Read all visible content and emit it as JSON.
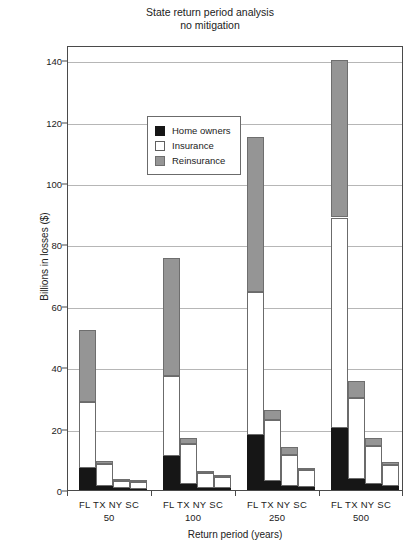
{
  "chart_data": {
    "type": "bar",
    "subtype": "stacked-grouped-bar",
    "title": "State return period analysis",
    "subtitle": "no mitigation",
    "xlabel": "Return period (years)",
    "ylabel": "Billions in losses ($)",
    "ylim": [
      0,
      145
    ],
    "yticks": [
      0,
      20,
      40,
      60,
      80,
      100,
      120,
      140
    ],
    "ytick_labels": [
      "0",
      "20",
      "40",
      "60",
      "80",
      "100",
      "120",
      "140"
    ],
    "grid": "horizontal",
    "legend_position": "upper-left-inside",
    "groups": [
      "50",
      "100",
      "250",
      "500"
    ],
    "group_labels": [
      "FL TX NY SC",
      "FL TX NY SC",
      "FL TX NY SC",
      "FL TX NY SC"
    ],
    "categories": [
      "FL",
      "TX",
      "NY",
      "SC"
    ],
    "series": [
      {
        "name": "Home owners",
        "color": "#161616",
        "values": {
          "50": [
            7.3,
            1.3,
            0.5,
            0.4
          ],
          "100": [
            11.0,
            2.0,
            0.8,
            0.6
          ],
          "250": [
            17.8,
            3.0,
            1.4,
            0.9
          ],
          "500": [
            20.2,
            3.6,
            1.9,
            1.2
          ]
        }
      },
      {
        "name": "Insurance",
        "color": "#ffffff",
        "values": {
          "50": [
            21.3,
            7.2,
            2.4,
            2.1
          ],
          "100": [
            26.0,
            13.0,
            4.6,
            3.8
          ],
          "250": [
            46.8,
            19.8,
            10.1,
            5.6
          ],
          "500": [
            68.6,
            26.4,
            12.6,
            6.8
          ]
        }
      },
      {
        "name": "Reinsurance",
        "color": "#959595",
        "values": {
          "50": [
            23.4,
            0.9,
            0.3,
            0.2
          ],
          "100": [
            38.6,
            2.0,
            0.6,
            0.5
          ],
          "250": [
            50.4,
            3.2,
            2.5,
            0.5
          ],
          "500": [
            51.2,
            5.5,
            2.5,
            1.0
          ]
        }
      }
    ],
    "totals": {
      "50": [
        52.0,
        9.4,
        3.2,
        2.7
      ],
      "100": [
        75.6,
        17.0,
        6.0,
        4.9
      ],
      "250": [
        115.0,
        26.0,
        14.0,
        7.0
      ],
      "500": [
        140.0,
        35.5,
        17.0,
        9.0
      ]
    }
  },
  "legend": {
    "items": [
      {
        "label": "Home owners",
        "swatch": "home"
      },
      {
        "label": "Insurance",
        "swatch": "ins"
      },
      {
        "label": "Reinsurance",
        "swatch": "rein"
      }
    ]
  }
}
